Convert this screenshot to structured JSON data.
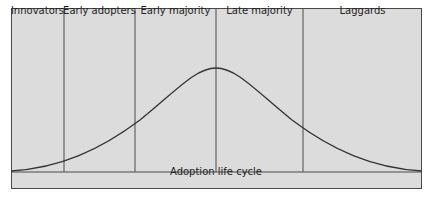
{
  "diagram": {
    "title": "Adoption life cycle",
    "segments": [
      {
        "label": "Innovators",
        "x_start": 11,
        "x_end": 64
      },
      {
        "label": "Early adopters",
        "x_start": 64,
        "x_end": 135
      },
      {
        "label": "Early majority",
        "x_start": 135,
        "x_end": 216
      },
      {
        "label": "Late majority",
        "x_start": 216,
        "x_end": 303
      },
      {
        "label": "Laggards",
        "x_start": 303,
        "x_end": 422
      }
    ],
    "curve": {
      "type": "bell",
      "peak_x": 216,
      "peak_y": 68,
      "baseline_y": 172
    },
    "colors": {
      "background": "#dcdcdc",
      "line": "#4a4a4a",
      "curve": "#333333"
    }
  }
}
